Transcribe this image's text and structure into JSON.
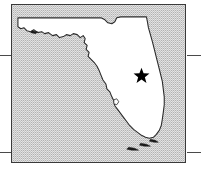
{
  "figure": {
    "kind": "locator-map",
    "region_label": "Florida",
    "width": 201,
    "height": 176,
    "background_color": "#ffffff"
  },
  "frame": {
    "border_color": "#3a3a3a",
    "fill_color": "#c7c7c7",
    "left": 11,
    "top": 4,
    "width": 175,
    "height": 159
  },
  "land": {
    "name_label": "Florida",
    "fill_color": "#ffffff",
    "outline_color": "#2b2b2b"
  },
  "water": {
    "name_label": "Surrounding waters",
    "fill_color": "#c7c7c7",
    "pattern": "halftone-dither"
  },
  "marker": {
    "symbol": "star",
    "name_label": "Site location",
    "color": "#000000",
    "x": 142,
    "y": 76,
    "size": 17
  },
  "graticule": {
    "color": "#4a4a4a",
    "ticks": [
      {
        "id": "lat-north-left",
        "side": "left",
        "y": 55
      },
      {
        "id": "lat-north-right",
        "side": "right",
        "y": 55
      },
      {
        "id": "lat-south-left",
        "side": "left",
        "y": 152
      },
      {
        "id": "lat-south-right",
        "side": "right",
        "y": 152
      }
    ]
  },
  "alt_text": "Outline map of Florida shaded white against a gray stippled background, with a black star marking a location on the east-central peninsula."
}
